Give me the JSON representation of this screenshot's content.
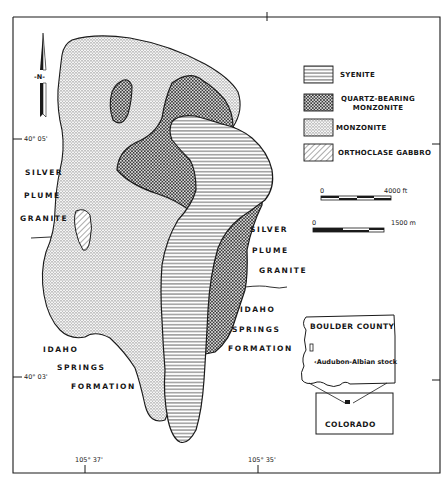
{
  "map": {
    "title": "Audubon-Albian stock geologic map",
    "north_arrow": {
      "label": "-N-"
    },
    "legend": [
      {
        "id": "syenite",
        "label": "SYENITE",
        "pattern": "horizontal-lines"
      },
      {
        "id": "qbm",
        "label_line1": "QUARTZ-BEARING",
        "label_line2": "MONZONITE",
        "pattern": "crosshatch"
      },
      {
        "id": "monzonite",
        "label": "MONZONITE",
        "pattern": "fine-vertical-stipple"
      },
      {
        "id": "gabbro",
        "label": "ORTHOCLASE GABBRO",
        "pattern": "diagonal-lines"
      }
    ],
    "scale_bars": [
      {
        "start": "0",
        "end": "4000 ft"
      },
      {
        "start": "0",
        "end": "1500 m"
      }
    ],
    "formations": {
      "silver_plume_west": [
        "SILVER",
        "PLUME",
        "GRANITE"
      ],
      "silver_plume_east": [
        "SILVER",
        "PLUME",
        "GRANITE"
      ],
      "idaho_springs_west": [
        "IDAHO",
        "SPRINGS",
        "FORMATION"
      ],
      "idaho_springs_east": [
        "IDAHO",
        "SPRINGS",
        "FORMATION"
      ]
    },
    "coordinates": {
      "lat_north": "40° 05'",
      "lat_south": "40° 03'",
      "lon_west": "105° 37'",
      "lon_east": "105° 35'"
    },
    "inset": {
      "county": "BOULDER COUNTY",
      "stock_label": "Audubon-Albian stock",
      "state": "COLORADO"
    },
    "colors": {
      "ink": "#1a1a1a",
      "paper": "#ffffff"
    }
  }
}
